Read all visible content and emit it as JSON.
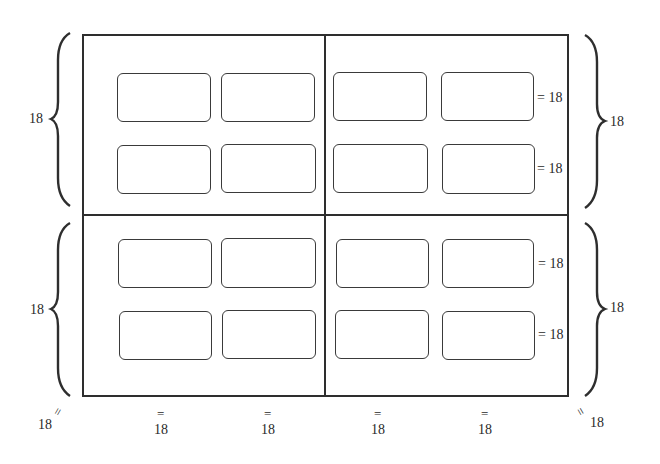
{
  "diagram": {
    "quadrants": [
      "top-left",
      "top-right",
      "bottom-left",
      "bottom-right"
    ],
    "rows_of_boxes": 4,
    "columns_of_boxes": 4,
    "left_braces": [
      {
        "label": "18"
      },
      {
        "label": "18"
      }
    ],
    "right_braces": [
      {
        "label": "18"
      },
      {
        "label": "18"
      }
    ],
    "row_gap_labels": [
      "= 18",
      "= 18",
      "= 18",
      "= 18"
    ],
    "bottom_labels": {
      "corner_left": {
        "mark": "=",
        "value": "18"
      },
      "columns": [
        {
          "mark": "=",
          "value": "18"
        },
        {
          "mark": "=",
          "value": "18"
        },
        {
          "mark": "=",
          "value": "18"
        },
        {
          "mark": "=",
          "value": "18"
        }
      ],
      "corner_right": {
        "mark": "=",
        "value": "18"
      }
    },
    "line_color": "#2e2e2e"
  }
}
